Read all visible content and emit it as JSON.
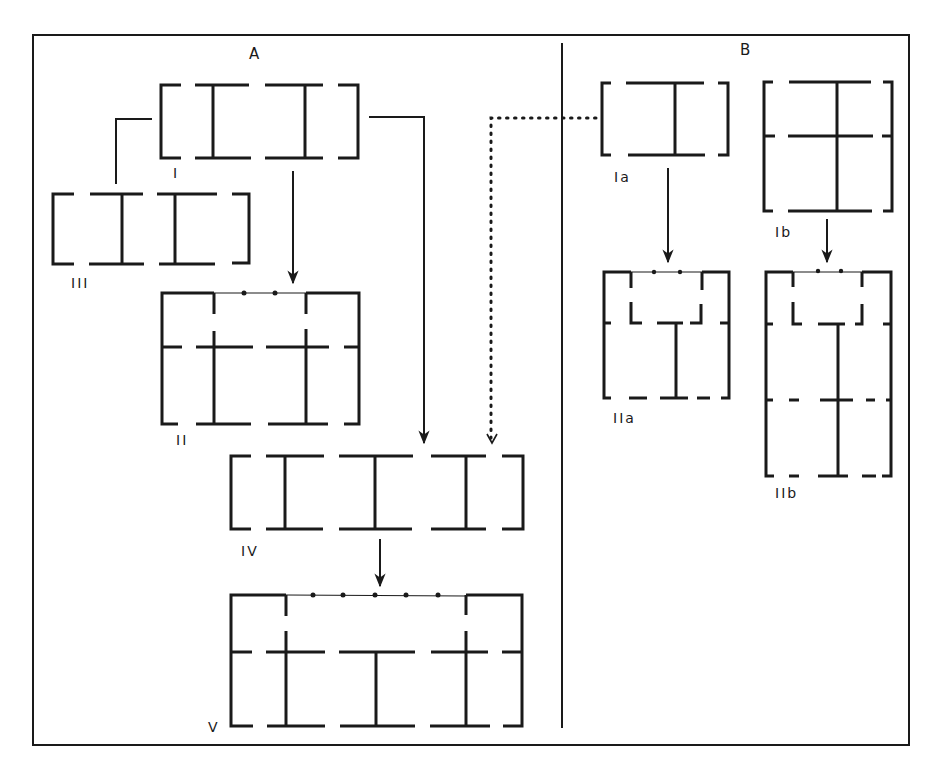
{
  "diagram": {
    "type": "architectural plan evolution diagram",
    "panels": [
      {
        "id": "A",
        "label": "A"
      },
      {
        "id": "B",
        "label": "B"
      }
    ],
    "plans": [
      {
        "id": "I",
        "label": "I",
        "panel": "A",
        "description": "three-bay plan, two internal cross walls"
      },
      {
        "id": "III",
        "label": "III",
        "panel": "A",
        "description": "three-bay plan variant"
      },
      {
        "id": "II",
        "label": "II",
        "panel": "A",
        "description": "three-bay plan with rear range and front colonnade (2 columns)"
      },
      {
        "id": "IV",
        "label": "IV",
        "panel": "A",
        "description": "four-bay plan, three internal cross walls"
      },
      {
        "id": "V",
        "label": "V",
        "panel": "A",
        "description": "four-bay plan with rear range and front colonnade (5 columns)"
      },
      {
        "id": "Ia",
        "label": "Ia",
        "panel": "B",
        "description": "two-bay plan, one internal cross wall"
      },
      {
        "id": "Ib",
        "label": "Ib",
        "panel": "B",
        "description": "two-bay, two-range plan"
      },
      {
        "id": "IIa",
        "label": "IIa",
        "panel": "B",
        "description": "plan with front colonnade (2 columns)"
      },
      {
        "id": "IIb",
        "label": "IIb",
        "panel": "B",
        "description": "extended plan with front colonnade (2 columns)"
      }
    ],
    "connections": [
      {
        "from": "I",
        "to": "III",
        "style": "solid line"
      },
      {
        "from": "I",
        "to": "II",
        "style": "arrow"
      },
      {
        "from": "I",
        "to": "IV",
        "style": "arrow"
      },
      {
        "from": "Ia",
        "to": "IV",
        "style": "dotted arrow"
      },
      {
        "from": "IV",
        "to": "V",
        "style": "arrow"
      },
      {
        "from": "Ia",
        "to": "IIa",
        "style": "arrow"
      },
      {
        "from": "Ib",
        "to": "IIb",
        "style": "arrow"
      }
    ]
  },
  "labels": {
    "panel_a": "A",
    "panel_b": "B",
    "plan_i": "I",
    "plan_iii": "III",
    "plan_ii": "II",
    "plan_iv": "IV",
    "plan_v": "V",
    "plan_ia": "Ia",
    "plan_ib": "Ib",
    "plan_iia": "IIa",
    "plan_iib": "IIb"
  },
  "colors": {
    "ink": "#1a1a1a",
    "background": "#ffffff"
  }
}
